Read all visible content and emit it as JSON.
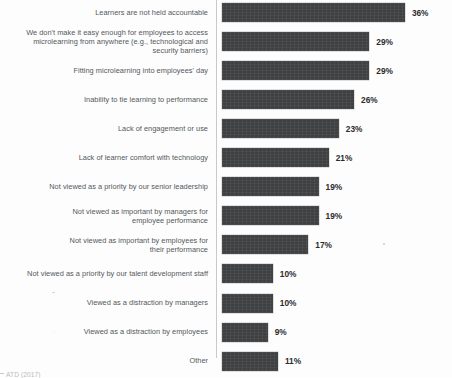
{
  "figure": {
    "source_note": "ATD (2017)",
    "bar_color": "#3f4042",
    "label_color": "#53585c",
    "value_color": "#2b2b2b",
    "axis_color": "#c9c9c9",
    "background": "#fdfdfd"
  },
  "chart_data": {
    "type": "bar",
    "orientation": "horizontal",
    "title": "",
    "subtitle": "",
    "xlabel": "",
    "ylabel": "",
    "xlim": [
      0,
      40
    ],
    "grid": false,
    "legend": null,
    "value_suffix": "%",
    "categories": [
      "Learners are not held accountable",
      "We don't make it easy enough for employees to access microlearning from anywhere (e.g., technological and security barriers)",
      "Fitting microlearning into employees' day",
      "Inability to tie learning to performance",
      "Lack of engagement or use",
      "Lack of learner comfort with technology",
      "Not viewed as a priority by our senior leadership",
      "Not viewed as important by managers for employee performance",
      "Not viewed as important by employees for their performance",
      "Not viewed as a priority by our talent development staff",
      "Viewed as a distraction by managers",
      "Viewed as a distraction by employees",
      "Other"
    ],
    "values": [
      36,
      29,
      29,
      26,
      23,
      21,
      19,
      19,
      17,
      10,
      10,
      9,
      11
    ],
    "value_labels": [
      "36%",
      "29%",
      "29%",
      "26%",
      "23%",
      "21%",
      "19%",
      "19%",
      "17%",
      "10%",
      "10%",
      "9%",
      "11%"
    ],
    "category_lines": [
      [
        "Learners are not held accountable"
      ],
      [
        "We don't make it easy enough for employees to access",
        "microlearning from anywhere (e.g., technological and",
        "security barriers)"
      ],
      [
        "Fitting microlearning into employees' day"
      ],
      [
        "Inability to tie learning to performance"
      ],
      [
        "Lack of engagement or use"
      ],
      [
        "Lack of learner comfort with technology"
      ],
      [
        "Not viewed as a priority by our senior leadership"
      ],
      [
        "Not viewed as important by managers for",
        "employee performance"
      ],
      [
        "Not viewed as important by employees for",
        "their performance"
      ],
      [
        "Not viewed as a priority by our talent development staff"
      ],
      [
        "Viewed as a distraction by managers"
      ],
      [
        "Viewed as a distraction by employees"
      ],
      [
        "Other"
      ]
    ]
  }
}
